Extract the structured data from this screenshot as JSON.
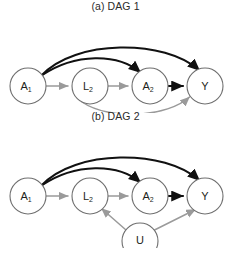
{
  "figure": {
    "background_color": "#ffffff",
    "edge_black_color": "#111111",
    "edge_gray_color": "#9a9a9a",
    "node_stroke_color": "#6f6f6f",
    "node_fill_color": "#ffffff"
  },
  "panels": [
    {
      "id": "a",
      "title": "(a) DAG 1",
      "nodes": [
        {
          "id": "A1",
          "base": "A",
          "sub": "1",
          "cx": 28,
          "cy": 73,
          "r": 18
        },
        {
          "id": "L2",
          "base": "L",
          "sub": "2",
          "cx": 90,
          "cy": 73,
          "r": 18
        },
        {
          "id": "A2",
          "base": "A",
          "sub": "2",
          "cx": 150,
          "cy": 73,
          "r": 18
        },
        {
          "id": "Y",
          "base": "Y",
          "sub": "",
          "cx": 205,
          "cy": 73,
          "r": 18
        }
      ],
      "edges": [
        {
          "from": "A1",
          "to": "L2",
          "color": "gray",
          "shape": "straight"
        },
        {
          "from": "L2",
          "to": "A2",
          "color": "gray",
          "shape": "straight"
        },
        {
          "from": "A2",
          "to": "Y",
          "color": "black",
          "shape": "straight"
        },
        {
          "from": "A1",
          "to": "A2",
          "color": "black",
          "shape": "arc-over"
        },
        {
          "from": "A1",
          "to": "Y",
          "color": "black",
          "shape": "arc-over-high"
        },
        {
          "from": "L2",
          "to": "Y",
          "color": "gray",
          "shape": "arc-under"
        }
      ]
    },
    {
      "id": "b",
      "title": "(b) DAG 2",
      "nodes": [
        {
          "id": "A1",
          "base": "A",
          "sub": "1",
          "cx": 28,
          "cy": 73,
          "r": 18
        },
        {
          "id": "L2",
          "base": "L",
          "sub": "2",
          "cx": 90,
          "cy": 73,
          "r": 18
        },
        {
          "id": "A2",
          "base": "A",
          "sub": "2",
          "cx": 150,
          "cy": 73,
          "r": 18
        },
        {
          "id": "Y",
          "base": "Y",
          "sub": "",
          "cx": 205,
          "cy": 73,
          "r": 18
        },
        {
          "id": "U",
          "base": "U",
          "sub": "",
          "cx": 140,
          "cy": 118,
          "r": 18
        }
      ],
      "edges": [
        {
          "from": "A1",
          "to": "L2",
          "color": "gray",
          "shape": "straight"
        },
        {
          "from": "L2",
          "to": "A2",
          "color": "gray",
          "shape": "straight"
        },
        {
          "from": "A2",
          "to": "Y",
          "color": "black",
          "shape": "straight"
        },
        {
          "from": "A1",
          "to": "A2",
          "color": "black",
          "shape": "arc-over"
        },
        {
          "from": "A1",
          "to": "Y",
          "color": "black",
          "shape": "arc-over-high"
        },
        {
          "from": "U",
          "to": "L2",
          "color": "gray",
          "shape": "straight"
        },
        {
          "from": "U",
          "to": "Y",
          "color": "gray",
          "shape": "straight"
        }
      ]
    }
  ]
}
